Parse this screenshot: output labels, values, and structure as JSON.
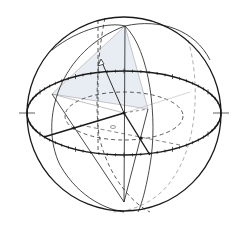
{
  "diagram": {
    "type": "geometric-sphere",
    "colors": {
      "background": "#ffffff",
      "stroke": "#1a1a1a",
      "dashed": "#333333",
      "light_dashed": "#9a9a9a",
      "shade": "#e8edf3",
      "light_line": "#b8b8b8"
    },
    "sphere": {
      "cx": 124,
      "cy": 114,
      "r": 97
    },
    "equator": {
      "cx": 124,
      "cy": 113,
      "rx": 97,
      "ry": 42
    },
    "inner_dashed_ellipse": {
      "cx": 124,
      "cy": 116,
      "rx": 59,
      "ry": 24
    },
    "points": {
      "north": [
        125,
        26
      ],
      "south": [
        124,
        202
      ],
      "center": [
        124,
        113
      ],
      "front_left": [
        44,
        137
      ],
      "front_right": [
        150,
        155
      ],
      "shade_left": [
        52,
        94
      ],
      "shade_right": [
        148,
        109
      ],
      "arrow_tip": [
        101,
        60
      ],
      "small_mark": [
        113,
        127
      ]
    },
    "tick_count": 72
  }
}
